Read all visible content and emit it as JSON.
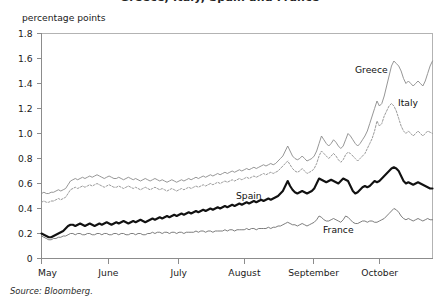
{
  "figure": {
    "title": "Greece, Italy, Spain and France",
    "unit_label": "percentage points",
    "source": "Source: Bloomberg."
  },
  "axes": {
    "y_ticks": [
      "1.8",
      "1.6",
      "1.4",
      "1.2",
      "1.0",
      "0.8",
      "0.6",
      "0.4",
      "0.2",
      "0"
    ],
    "x_ticks": [
      "May",
      "June",
      "July",
      "August",
      "September",
      "October"
    ]
  },
  "series_labels": {
    "greece": "Greece",
    "italy": "Italy",
    "spain": "Spain",
    "france": "France"
  },
  "colors": {
    "greece": "#8a8a8a",
    "italy": "#9a9a9a",
    "spain": "#111111",
    "france": "#6e6e6e",
    "axis": "#8c8c8c",
    "frame": "#b3b3b3",
    "text": "#1a1a1a"
  },
  "chart_data": {
    "type": "line",
    "title": "Greece, Italy, Spain and France",
    "xlabel": "",
    "ylabel": "percentage points",
    "ylim": [
      0,
      1.8
    ],
    "y_ticks": [
      0,
      0.2,
      0.4,
      0.6,
      0.8,
      1.0,
      1.2,
      1.4,
      1.6,
      1.8
    ],
    "grid": false,
    "legend": "inline-annotations",
    "x_tick_labels": [
      "May",
      "June",
      "July",
      "August",
      "September",
      "October"
    ],
    "x_tick_fractions": [
      0.0,
      0.171,
      0.351,
      0.519,
      0.696,
      0.865
    ],
    "x_description": "Daily observations from early May through late October",
    "series": [
      {
        "name": "Greece",
        "style": "thin-solid",
        "values": [
          0.52,
          0.53,
          0.52,
          0.52,
          0.53,
          0.53,
          0.54,
          0.55,
          0.54,
          0.55,
          0.56,
          0.59,
          0.62,
          0.63,
          0.64,
          0.63,
          0.64,
          0.65,
          0.64,
          0.65,
          0.66,
          0.65,
          0.66,
          0.67,
          0.66,
          0.65,
          0.64,
          0.65,
          0.66,
          0.65,
          0.64,
          0.64,
          0.65,
          0.64,
          0.63,
          0.64,
          0.65,
          0.64,
          0.63,
          0.64,
          0.63,
          0.62,
          0.63,
          0.64,
          0.63,
          0.62,
          0.63,
          0.64,
          0.63,
          0.62,
          0.63,
          0.62,
          0.61,
          0.62,
          0.63,
          0.62,
          0.61,
          0.62,
          0.63,
          0.62,
          0.63,
          0.64,
          0.63,
          0.64,
          0.65,
          0.64,
          0.65,
          0.66,
          0.65,
          0.66,
          0.67,
          0.66,
          0.67,
          0.68,
          0.67,
          0.68,
          0.69,
          0.68,
          0.69,
          0.7,
          0.69,
          0.7,
          0.71,
          0.7,
          0.71,
          0.72,
          0.71,
          0.72,
          0.73,
          0.72,
          0.73,
          0.74,
          0.75,
          0.74,
          0.75,
          0.76,
          0.75,
          0.76,
          0.78,
          0.8,
          0.82,
          0.86,
          0.9,
          0.86,
          0.82,
          0.8,
          0.79,
          0.8,
          0.82,
          0.8,
          0.78,
          0.79,
          0.8,
          0.82,
          0.86,
          0.92,
          0.98,
          0.95,
          0.92,
          0.9,
          0.92,
          0.95,
          0.93,
          0.9,
          0.88,
          0.9,
          0.95,
          1.0,
          0.98,
          0.95,
          0.92,
          0.9,
          0.92,
          0.95,
          0.98,
          1.02,
          1.08,
          1.14,
          1.2,
          1.26,
          1.22,
          1.24,
          1.3,
          1.38,
          1.46,
          1.54,
          1.58,
          1.56,
          1.54,
          1.5,
          1.44,
          1.4,
          1.42,
          1.4,
          1.38,
          1.4,
          1.42,
          1.4,
          1.38,
          1.42,
          1.48,
          1.54,
          1.58
        ],
        "start_value": 0.52,
        "peak_value": 1.58,
        "end_value": 1.58
      },
      {
        "name": "Italy",
        "style": "dotted",
        "values": [
          0.45,
          0.46,
          0.45,
          0.45,
          0.46,
          0.46,
          0.47,
          0.48,
          0.47,
          0.48,
          0.49,
          0.52,
          0.55,
          0.56,
          0.57,
          0.56,
          0.57,
          0.58,
          0.57,
          0.58,
          0.59,
          0.58,
          0.59,
          0.6,
          0.59,
          0.58,
          0.57,
          0.58,
          0.59,
          0.58,
          0.57,
          0.57,
          0.58,
          0.57,
          0.56,
          0.57,
          0.58,
          0.57,
          0.56,
          0.57,
          0.56,
          0.55,
          0.56,
          0.57,
          0.56,
          0.55,
          0.56,
          0.57,
          0.56,
          0.55,
          0.56,
          0.55,
          0.54,
          0.55,
          0.56,
          0.55,
          0.54,
          0.55,
          0.56,
          0.55,
          0.56,
          0.57,
          0.56,
          0.57,
          0.58,
          0.57,
          0.58,
          0.59,
          0.58,
          0.59,
          0.6,
          0.59,
          0.6,
          0.61,
          0.6,
          0.61,
          0.62,
          0.61,
          0.62,
          0.63,
          0.62,
          0.63,
          0.64,
          0.63,
          0.64,
          0.65,
          0.64,
          0.65,
          0.66,
          0.65,
          0.66,
          0.67,
          0.68,
          0.67,
          0.68,
          0.69,
          0.68,
          0.69,
          0.7,
          0.72,
          0.74,
          0.76,
          0.78,
          0.75,
          0.72,
          0.7,
          0.69,
          0.7,
          0.72,
          0.7,
          0.68,
          0.69,
          0.7,
          0.72,
          0.76,
          0.82,
          0.86,
          0.84,
          0.82,
          0.8,
          0.82,
          0.84,
          0.82,
          0.79,
          0.77,
          0.79,
          0.83,
          0.85,
          0.84,
          0.82,
          0.8,
          0.78,
          0.8,
          0.82,
          0.84,
          0.88,
          0.92,
          0.96,
          1.02,
          1.1,
          1.06,
          1.08,
          1.14,
          1.18,
          1.22,
          1.24,
          1.22,
          1.18,
          1.12,
          1.06,
          1.02,
          1.0,
          1.02,
          1.0,
          0.98,
          1.0,
          1.02,
          1.0,
          0.98,
          1.0,
          1.02,
          1.01,
          1.0
        ],
        "start_value": 0.45,
        "peak_value": 1.24,
        "end_value": 1.0
      },
      {
        "name": "Spain",
        "style": "bold-solid",
        "values": [
          0.2,
          0.19,
          0.18,
          0.17,
          0.17,
          0.18,
          0.19,
          0.2,
          0.21,
          0.22,
          0.24,
          0.26,
          0.27,
          0.27,
          0.26,
          0.27,
          0.28,
          0.27,
          0.26,
          0.27,
          0.28,
          0.27,
          0.26,
          0.27,
          0.28,
          0.27,
          0.28,
          0.29,
          0.28,
          0.27,
          0.28,
          0.29,
          0.28,
          0.29,
          0.3,
          0.29,
          0.28,
          0.29,
          0.3,
          0.29,
          0.3,
          0.31,
          0.3,
          0.29,
          0.3,
          0.31,
          0.32,
          0.31,
          0.32,
          0.33,
          0.32,
          0.33,
          0.34,
          0.33,
          0.34,
          0.35,
          0.34,
          0.35,
          0.36,
          0.35,
          0.36,
          0.37,
          0.36,
          0.37,
          0.38,
          0.37,
          0.38,
          0.39,
          0.38,
          0.39,
          0.4,
          0.39,
          0.4,
          0.41,
          0.4,
          0.41,
          0.42,
          0.41,
          0.42,
          0.43,
          0.42,
          0.43,
          0.44,
          0.43,
          0.44,
          0.45,
          0.44,
          0.45,
          0.46,
          0.45,
          0.46,
          0.47,
          0.46,
          0.47,
          0.48,
          0.47,
          0.48,
          0.49,
          0.5,
          0.52,
          0.54,
          0.58,
          0.62,
          0.58,
          0.55,
          0.53,
          0.52,
          0.53,
          0.54,
          0.53,
          0.52,
          0.53,
          0.54,
          0.56,
          0.6,
          0.64,
          0.63,
          0.62,
          0.61,
          0.62,
          0.63,
          0.62,
          0.61,
          0.6,
          0.62,
          0.64,
          0.63,
          0.62,
          0.58,
          0.54,
          0.52,
          0.53,
          0.55,
          0.57,
          0.58,
          0.57,
          0.58,
          0.6,
          0.62,
          0.61,
          0.62,
          0.64,
          0.66,
          0.68,
          0.7,
          0.72,
          0.73,
          0.72,
          0.7,
          0.66,
          0.62,
          0.6,
          0.61,
          0.6,
          0.59,
          0.6,
          0.61,
          0.6,
          0.59,
          0.58,
          0.57,
          0.56,
          0.56
        ],
        "start_value": 0.2,
        "peak_value": 0.73,
        "end_value": 0.56
      },
      {
        "name": "France",
        "style": "thin-solid",
        "values": [
          0.18,
          0.17,
          0.16,
          0.15,
          0.15,
          0.16,
          0.16,
          0.17,
          0.17,
          0.18,
          0.18,
          0.19,
          0.2,
          0.2,
          0.19,
          0.2,
          0.2,
          0.19,
          0.19,
          0.2,
          0.2,
          0.19,
          0.19,
          0.2,
          0.2,
          0.19,
          0.2,
          0.2,
          0.19,
          0.19,
          0.2,
          0.2,
          0.19,
          0.2,
          0.2,
          0.19,
          0.19,
          0.2,
          0.2,
          0.19,
          0.2,
          0.2,
          0.19,
          0.19,
          0.2,
          0.2,
          0.21,
          0.2,
          0.21,
          0.21,
          0.2,
          0.21,
          0.21,
          0.2,
          0.21,
          0.21,
          0.2,
          0.21,
          0.21,
          0.2,
          0.21,
          0.21,
          0.21,
          0.21,
          0.22,
          0.21,
          0.22,
          0.22,
          0.21,
          0.22,
          0.22,
          0.21,
          0.22,
          0.22,
          0.22,
          0.22,
          0.23,
          0.22,
          0.23,
          0.23,
          0.22,
          0.23,
          0.23,
          0.23,
          0.23,
          0.24,
          0.23,
          0.24,
          0.24,
          0.23,
          0.24,
          0.24,
          0.24,
          0.24,
          0.25,
          0.24,
          0.25,
          0.25,
          0.26,
          0.26,
          0.27,
          0.28,
          0.29,
          0.28,
          0.27,
          0.27,
          0.26,
          0.27,
          0.28,
          0.27,
          0.26,
          0.27,
          0.28,
          0.29,
          0.31,
          0.34,
          0.33,
          0.31,
          0.3,
          0.3,
          0.31,
          0.32,
          0.31,
          0.3,
          0.29,
          0.31,
          0.34,
          0.33,
          0.31,
          0.29,
          0.28,
          0.28,
          0.29,
          0.3,
          0.3,
          0.29,
          0.3,
          0.3,
          0.29,
          0.29,
          0.3,
          0.31,
          0.32,
          0.34,
          0.36,
          0.38,
          0.4,
          0.39,
          0.37,
          0.34,
          0.32,
          0.31,
          0.32,
          0.31,
          0.3,
          0.31,
          0.32,
          0.31,
          0.3,
          0.31,
          0.32,
          0.31,
          0.31
        ],
        "start_value": 0.18,
        "peak_value": 0.4,
        "end_value": 0.31
      }
    ]
  }
}
